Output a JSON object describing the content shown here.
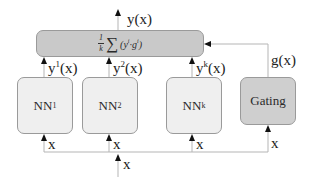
{
  "diagram": {
    "output": {
      "label": "y(x)"
    },
    "combiner": {
      "formula": "1/k Σ (y^i · g^i)",
      "fraction_numerator": "1",
      "fraction_denominator": "k",
      "sigma": "∑",
      "term_y": "y",
      "term_y_sup": "i",
      "term_dot": "·",
      "term_g": "g",
      "term_g_sup": "i",
      "open_paren": "(",
      "close_paren": ")"
    },
    "experts": [
      {
        "name": "NN",
        "subscript": "1",
        "output_base": "y",
        "output_sup": "1",
        "output_arg": "(x)",
        "input_label": "x"
      },
      {
        "name": "NN",
        "subscript": "2",
        "output_base": "y",
        "output_sup": "2",
        "output_arg": "(x)",
        "input_label": "x"
      },
      {
        "name": "NN",
        "subscript": "k",
        "output_base": "y",
        "output_sup": "k",
        "output_arg": "(x)",
        "input_label": "x"
      }
    ],
    "gating": {
      "label": "Gating",
      "output_label": "g(x)",
      "input_label": "x"
    },
    "input": {
      "label": "x"
    },
    "colors": {
      "combiner_fill": "#c9c9c9",
      "expert_fill": "#efefef",
      "gating_fill": "#cfcfcf",
      "border": "#9a9a9a",
      "line": "#b5b5b5",
      "arrowhead": "#111111"
    }
  }
}
